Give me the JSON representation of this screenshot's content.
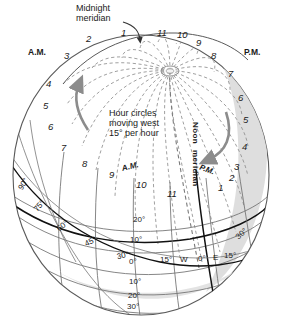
{
  "diagram": {
    "background_color": "#ffffff",
    "sphere": {
      "outline_color": "#555555",
      "shadow_color": "#d9d9d9",
      "fill_color": "#ffffff"
    },
    "callouts": {
      "midnight_meridian": "Midnight\nmeridian",
      "midnight_line1": "Midnight",
      "midnight_line2": "meridian",
      "hour_circles_note_line1": "Hour circles",
      "hour_circles_note_line2": "moving west",
      "hour_circles_note_line3": "15° per hour",
      "noon_meridian_line1": "Noon",
      "noon_meridian_line2": "meridian"
    },
    "meridian_colors": {
      "hour_circle": "#8a8a8a",
      "graticule": "#6f6f6f",
      "bold_meridian": "#111111",
      "arrow": "#808080"
    },
    "am_label": "A.M.",
    "pm_label": "P.M.",
    "am_label_lower": "A.M.",
    "pm_label_lower": "P.M.",
    "top_hours": [
      {
        "label": "2",
        "x": 86,
        "y": 34
      },
      {
        "label": "1",
        "x": 121,
        "y": 28
      },
      {
        "label": "11",
        "x": 157,
        "y": 28
      },
      {
        "label": "10",
        "x": 177,
        "y": 30
      },
      {
        "label": "9",
        "x": 196,
        "y": 38
      }
    ],
    "left_hours": [
      {
        "label": "3",
        "x": 64,
        "y": 51
      },
      {
        "label": "4",
        "x": 46,
        "y": 79
      },
      {
        "label": "5",
        "x": 43,
        "y": 101
      },
      {
        "label": "6",
        "x": 48,
        "y": 122
      },
      {
        "label": "7",
        "x": 61,
        "y": 143
      },
      {
        "label": "8",
        "x": 82,
        "y": 159
      }
    ],
    "right_hours": [
      {
        "label": "8",
        "x": 211,
        "y": 51
      },
      {
        "label": "7",
        "x": 228,
        "y": 69
      },
      {
        "label": "6",
        "x": 238,
        "y": 93
      },
      {
        "label": "5",
        "x": 243,
        "y": 115
      },
      {
        "label": "4",
        "x": 242,
        "y": 142
      },
      {
        "label": "3",
        "x": 234,
        "y": 162
      }
    ],
    "lower_hours": [
      {
        "label": "9",
        "x": 109,
        "y": 170
      },
      {
        "label": "10",
        "x": 136,
        "y": 180
      },
      {
        "label": "11",
        "x": 167,
        "y": 189
      },
      {
        "label": "1",
        "x": 218,
        "y": 183
      },
      {
        "label": "2",
        "x": 229,
        "y": 173
      }
    ],
    "oblique_degrees": [
      {
        "label": "90°",
        "x": 18,
        "y": 180,
        "rot": -58
      },
      {
        "label": "75°",
        "x": 34,
        "y": 202,
        "rot": -48
      },
      {
        "label": "60°",
        "x": 57,
        "y": 222,
        "rot": -38
      },
      {
        "label": "45°",
        "x": 85,
        "y": 238,
        "rot": -26
      },
      {
        "label": "30°",
        "x": 117,
        "y": 252,
        "rot": -12
      },
      {
        "label": "30°",
        "x": 236,
        "y": 230,
        "rot": -42
      }
    ],
    "latitude_ladder": [
      {
        "label": "20°",
        "x": 133,
        "y": 216
      },
      {
        "label": "10°",
        "x": 130,
        "y": 236
      },
      {
        "label": "0°",
        "x": 129,
        "y": 258
      },
      {
        "label": "10°",
        "x": 129,
        "y": 278
      },
      {
        "label": "20°",
        "x": 128,
        "y": 292
      },
      {
        "label": "30°",
        "x": 127,
        "y": 303
      }
    ],
    "equator_labels": [
      {
        "label": "15°",
        "x": 160,
        "y": 256
      },
      {
        "label": "W",
        "x": 180,
        "y": 256
      },
      {
        "label": "0°",
        "x": 198,
        "y": 255
      },
      {
        "label": "E",
        "x": 213,
        "y": 254
      },
      {
        "label": "15°",
        "x": 224,
        "y": 252
      }
    ]
  },
  "chart_data": {
    "type": "diagram",
    "hour_circle_count": 24,
    "hour_spacing_degrees": 15,
    "hour_labels_am": [
      "3",
      "4",
      "5",
      "6",
      "7",
      "8",
      "9",
      "10",
      "11"
    ],
    "hour_labels_pm": [
      "1",
      "2",
      "3",
      "4",
      "5",
      "6",
      "7",
      "8",
      "9",
      "10",
      "11"
    ],
    "special_meridians": [
      "Midnight meridian",
      "Noon meridian"
    ],
    "latitude_ticks": [
      "30°",
      "20°",
      "10°",
      "0°",
      "10°",
      "20°",
      "30°"
    ],
    "longitude_ticks": [
      "15° W",
      "0°",
      "15° E"
    ],
    "oblique_ticks": [
      "90°",
      "75°",
      "60°",
      "45°",
      "30°"
    ],
    "rotation_direction": "west",
    "rotation_rate": "15° per hour"
  }
}
